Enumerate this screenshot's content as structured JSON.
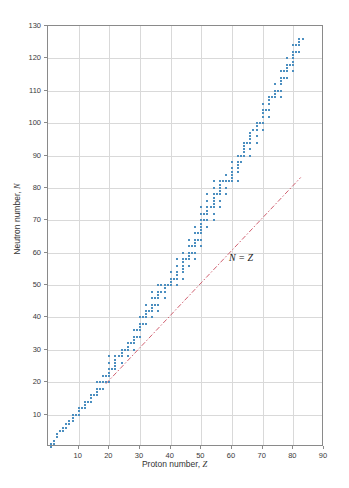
{
  "chart_data": {
    "type": "scatter",
    "title": "",
    "xlabel": "Proton number, Z",
    "ylabel": "Neutron number, N",
    "xlim": [
      0,
      90
    ],
    "ylim": [
      0,
      130
    ],
    "xticks": [
      10,
      20,
      30,
      40,
      50,
      60,
      70,
      80,
      90
    ],
    "yticks": [
      10,
      20,
      30,
      40,
      50,
      60,
      70,
      80,
      90,
      100,
      110,
      120,
      130
    ],
    "grid": true,
    "legend": "none",
    "series": [
      {
        "name": "stable nuclides",
        "marker": "square",
        "color": "#4c8fc0",
        "points": [
          [
            1,
            0
          ],
          [
            1,
            1
          ],
          [
            2,
            1
          ],
          [
            2,
            2
          ],
          [
            3,
            3
          ],
          [
            3,
            4
          ],
          [
            4,
            5
          ],
          [
            5,
            5
          ],
          [
            5,
            6
          ],
          [
            6,
            6
          ],
          [
            6,
            7
          ],
          [
            7,
            7
          ],
          [
            7,
            8
          ],
          [
            8,
            8
          ],
          [
            8,
            9
          ],
          [
            8,
            10
          ],
          [
            9,
            10
          ],
          [
            10,
            10
          ],
          [
            10,
            11
          ],
          [
            10,
            12
          ],
          [
            11,
            12
          ],
          [
            12,
            12
          ],
          [
            12,
            13
          ],
          [
            12,
            14
          ],
          [
            13,
            14
          ],
          [
            14,
            14
          ],
          [
            14,
            15
          ],
          [
            14,
            16
          ],
          [
            15,
            16
          ],
          [
            16,
            16
          ],
          [
            16,
            17
          ],
          [
            16,
            18
          ],
          [
            16,
            20
          ],
          [
            17,
            18
          ],
          [
            17,
            20
          ],
          [
            18,
            18
          ],
          [
            18,
            20
          ],
          [
            18,
            22
          ],
          [
            19,
            20
          ],
          [
            19,
            22
          ],
          [
            20,
            20
          ],
          [
            20,
            22
          ],
          [
            20,
            23
          ],
          [
            20,
            24
          ],
          [
            20,
            26
          ],
          [
            20,
            28
          ],
          [
            21,
            24
          ],
          [
            22,
            24
          ],
          [
            22,
            25
          ],
          [
            22,
            26
          ],
          [
            22,
            27
          ],
          [
            22,
            28
          ],
          [
            23,
            28
          ],
          [
            24,
            26
          ],
          [
            24,
            28
          ],
          [
            24,
            29
          ],
          [
            24,
            30
          ],
          [
            25,
            30
          ],
          [
            26,
            28
          ],
          [
            26,
            30
          ],
          [
            26,
            31
          ],
          [
            26,
            32
          ],
          [
            27,
            32
          ],
          [
            28,
            30
          ],
          [
            28,
            32
          ],
          [
            28,
            33
          ],
          [
            28,
            34
          ],
          [
            28,
            36
          ],
          [
            29,
            34
          ],
          [
            29,
            36
          ],
          [
            30,
            34
          ],
          [
            30,
            36
          ],
          [
            30,
            37
          ],
          [
            30,
            38
          ],
          [
            30,
            40
          ],
          [
            31,
            38
          ],
          [
            31,
            40
          ],
          [
            32,
            38
          ],
          [
            32,
            40
          ],
          [
            32,
            41
          ],
          [
            32,
            42
          ],
          [
            32,
            44
          ],
          [
            33,
            42
          ],
          [
            34,
            40
          ],
          [
            34,
            42
          ],
          [
            34,
            43
          ],
          [
            34,
            44
          ],
          [
            34,
            46
          ],
          [
            34,
            48
          ],
          [
            35,
            44
          ],
          [
            35,
            46
          ],
          [
            36,
            42
          ],
          [
            36,
            44
          ],
          [
            36,
            46
          ],
          [
            36,
            47
          ],
          [
            36,
            48
          ],
          [
            36,
            50
          ],
          [
            37,
            48
          ],
          [
            37,
            50
          ],
          [
            38,
            46
          ],
          [
            38,
            48
          ],
          [
            38,
            49
          ],
          [
            38,
            50
          ],
          [
            39,
            50
          ],
          [
            40,
            50
          ],
          [
            40,
            51
          ],
          [
            40,
            52
          ],
          [
            40,
            54
          ],
          [
            41,
            52
          ],
          [
            42,
            50
          ],
          [
            42,
            52
          ],
          [
            42,
            53
          ],
          [
            42,
            54
          ],
          [
            42,
            56
          ],
          [
            42,
            58
          ],
          [
            44,
            52
          ],
          [
            44,
            54
          ],
          [
            44,
            55
          ],
          [
            44,
            56
          ],
          [
            44,
            57
          ],
          [
            44,
            58
          ],
          [
            44,
            60
          ],
          [
            45,
            58
          ],
          [
            46,
            56
          ],
          [
            46,
            58
          ],
          [
            46,
            59
          ],
          [
            46,
            60
          ],
          [
            46,
            62
          ],
          [
            46,
            64
          ],
          [
            47,
            60
          ],
          [
            47,
            62
          ],
          [
            48,
            58
          ],
          [
            48,
            60
          ],
          [
            48,
            62
          ],
          [
            48,
            63
          ],
          [
            48,
            64
          ],
          [
            48,
            66
          ],
          [
            48,
            68
          ],
          [
            49,
            64
          ],
          [
            49,
            66
          ],
          [
            50,
            62
          ],
          [
            50,
            64
          ],
          [
            50,
            66
          ],
          [
            50,
            67
          ],
          [
            50,
            68
          ],
          [
            50,
            69
          ],
          [
            50,
            70
          ],
          [
            50,
            72
          ],
          [
            50,
            74
          ],
          [
            51,
            70
          ],
          [
            51,
            72
          ],
          [
            52,
            68
          ],
          [
            52,
            70
          ],
          [
            52,
            72
          ],
          [
            52,
            73
          ],
          [
            52,
            74
          ],
          [
            52,
            76
          ],
          [
            52,
            78
          ],
          [
            53,
            74
          ],
          [
            54,
            70
          ],
          [
            54,
            72
          ],
          [
            54,
            74
          ],
          [
            54,
            75
          ],
          [
            54,
            76
          ],
          [
            54,
            77
          ],
          [
            54,
            78
          ],
          [
            54,
            80
          ],
          [
            54,
            82
          ],
          [
            55,
            78
          ],
          [
            56,
            74
          ],
          [
            56,
            76
          ],
          [
            56,
            78
          ],
          [
            56,
            79
          ],
          [
            56,
            80
          ],
          [
            56,
            81
          ],
          [
            56,
            82
          ],
          [
            57,
            82
          ],
          [
            58,
            78
          ],
          [
            58,
            80
          ],
          [
            58,
            82
          ],
          [
            58,
            84
          ],
          [
            59,
            82
          ],
          [
            60,
            82
          ],
          [
            60,
            83
          ],
          [
            60,
            84
          ],
          [
            60,
            85
          ],
          [
            60,
            86
          ],
          [
            60,
            88
          ],
          [
            62,
            82
          ],
          [
            62,
            85
          ],
          [
            62,
            86
          ],
          [
            62,
            87
          ],
          [
            62,
            88
          ],
          [
            62,
            90
          ],
          [
            63,
            88
          ],
          [
            63,
            90
          ],
          [
            64,
            90
          ],
          [
            64,
            91
          ],
          [
            64,
            92
          ],
          [
            64,
            93
          ],
          [
            64,
            94
          ],
          [
            65,
            94
          ],
          [
            66,
            90
          ],
          [
            66,
            92
          ],
          [
            66,
            94
          ],
          [
            66,
            95
          ],
          [
            66,
            96
          ],
          [
            66,
            97
          ],
          [
            67,
            98
          ],
          [
            68,
            94
          ],
          [
            68,
            96
          ],
          [
            68,
            98
          ],
          [
            68,
            99
          ],
          [
            68,
            100
          ],
          [
            69,
            100
          ],
          [
            70,
            98
          ],
          [
            70,
            100
          ],
          [
            70,
            102
          ],
          [
            70,
            103
          ],
          [
            70,
            104
          ],
          [
            70,
            106
          ],
          [
            71,
            104
          ],
          [
            72,
            102
          ],
          [
            72,
            104
          ],
          [
            72,
            106
          ],
          [
            72,
            107
          ],
          [
            72,
            108
          ],
          [
            73,
            108
          ],
          [
            74,
            108
          ],
          [
            74,
            109
          ],
          [
            74,
            110
          ],
          [
            74,
            112
          ],
          [
            75,
            110
          ],
          [
            76,
            108
          ],
          [
            76,
            110
          ],
          [
            112
          ],
          [
            76,
            112
          ],
          [
            76,
            113
          ],
          [
            76,
            114
          ],
          [
            76,
            116
          ],
          [
            77,
            114
          ],
          [
            77,
            116
          ],
          [
            78,
            114
          ],
          [
            78,
            116
          ],
          [
            78,
            117
          ],
          [
            78,
            118
          ],
          [
            78,
            120
          ],
          [
            79,
            118
          ],
          [
            80,
            116
          ],
          [
            80,
            118
          ],
          [
            80,
            119
          ],
          [
            80,
            120
          ],
          [
            80,
            121
          ],
          [
            80,
            122
          ],
          [
            80,
            124
          ],
          [
            81,
            122
          ],
          [
            81,
            124
          ],
          [
            82,
            122
          ],
          [
            82,
            124
          ],
          [
            82,
            125
          ],
          [
            82,
            126
          ],
          [
            83,
            126
          ]
        ]
      }
    ],
    "reference_line": {
      "label": "N = Z",
      "color": "#d06070",
      "style": "dashdot",
      "x_start": 19,
      "y_start": 19,
      "x_end": 83,
      "y_end": 83
    }
  }
}
